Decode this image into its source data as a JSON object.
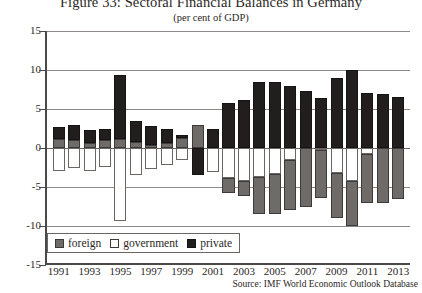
{
  "figure": {
    "title": "Figure 33: Sectoral Financial Balances in Germany",
    "subtitle": "(per cent of GDP)",
    "source": "Source: IMF World Economic Outlook Database"
  },
  "legend": {
    "position": "bottom-left",
    "items": [
      {
        "label": "foreign",
        "color": "#6e6b69",
        "key": "foreign"
      },
      {
        "label": "government",
        "color": "#ffffff",
        "key": "government"
      },
      {
        "label": "private",
        "color": "#211e1d",
        "key": "private"
      }
    ]
  },
  "axes": {
    "y_ticks": [
      "15",
      "10",
      "5",
      "0",
      "-5",
      "-10",
      "-15"
    ],
    "y_tick_values": [
      15,
      10,
      5,
      0,
      -5,
      -10,
      -15
    ],
    "x_tick_labels": [
      "1991",
      "1993",
      "1995",
      "1997",
      "1999",
      "2001",
      "2003",
      "2005",
      "2007",
      "2009",
      "2011",
      "2013"
    ]
  },
  "chart_data": {
    "type": "bar",
    "stacked": true,
    "title": "Figure 33: Sectoral Financial Balances in Germany",
    "subtitle": "(per cent of GDP)",
    "xlabel": "",
    "ylabel": "per cent of GDP",
    "ylim": [
      -15,
      15
    ],
    "grid": true,
    "legend_position": "bottom-left",
    "source": "Source: IMF World Economic Outlook Database",
    "categories": [
      "1991",
      "1992",
      "1993",
      "1994",
      "1995",
      "1996",
      "1997",
      "1998",
      "1999",
      "2000",
      "2001",
      "2002",
      "2003",
      "2004",
      "2005",
      "2006",
      "2007",
      "2008",
      "2009",
      "2010",
      "2011",
      "2012",
      "2013"
    ],
    "series": [
      {
        "name": "foreign",
        "color": "#6e6b69",
        "values": [
          1.2,
          1.0,
          0.7,
          1.0,
          1.2,
          0.8,
          0.4,
          0.7,
          1.3,
          3.0,
          0.0,
          -2.0,
          -1.9,
          -4.7,
          -5.1,
          -6.3,
          -7.5,
          -6.2,
          -5.8,
          -5.8,
          -6.2,
          -7.0,
          -6.6
        ]
      },
      {
        "name": "government",
        "color": "#ffffff",
        "values": [
          -3.0,
          -2.5,
          -3.0,
          -2.4,
          -9.4,
          -3.4,
          -2.7,
          -2.2,
          -1.6,
          1.1,
          -3.1,
          -3.8,
          -4.2,
          -3.7,
          -3.3,
          -1.6,
          0.2,
          -0.2,
          -3.2,
          -4.2,
          -0.8,
          0.1,
          0.0
        ]
      },
      {
        "name": "private",
        "color": "#211e1d",
        "values": [
          1.5,
          2.0,
          1.6,
          1.5,
          8.2,
          2.6,
          2.4,
          1.7,
          0.4,
          -3.5,
          2.4,
          5.8,
          6.1,
          8.4,
          8.4,
          7.9,
          7.3,
          6.4,
          9.0,
          10.0,
          7.0,
          6.9,
          6.6
        ]
      }
    ]
  }
}
